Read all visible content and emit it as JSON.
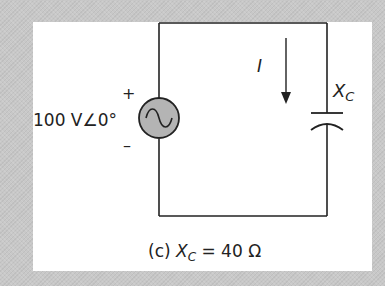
{
  "figure": {
    "caption_prefix": "(c) ",
    "caption_var": "X",
    "caption_sub": "C",
    "caption_rest": " = 40 Ω",
    "source_label": "100 V∠0°",
    "plus": "+",
    "minus": "–",
    "current_label": "I",
    "capacitor_label": "X",
    "capacitor_sub": "C"
  },
  "colors": {
    "wire": "#222222",
    "source_fill": "#b4b4b4",
    "panel": "#ffffff",
    "background": "#c8c8c8"
  }
}
